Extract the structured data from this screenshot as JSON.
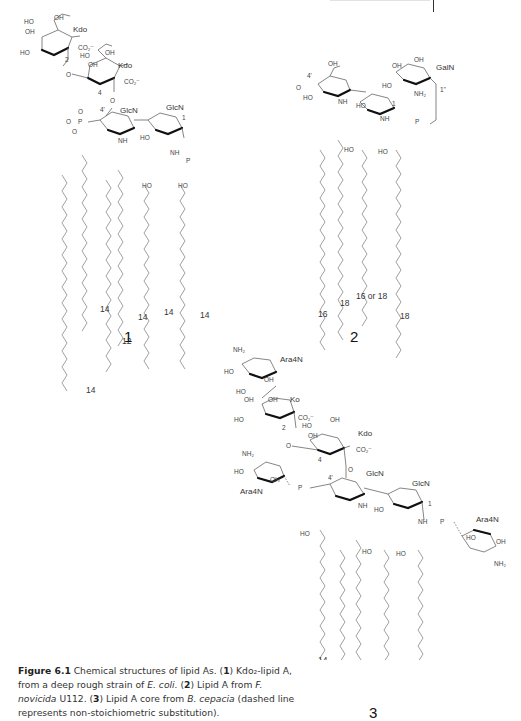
{
  "page": {
    "header_rule": true
  },
  "structures": [
    {
      "number": "1",
      "sugars": [
        "Kdo",
        "Kdo",
        "GlcN",
        "GlcN"
      ],
      "positions": [
        "2",
        "4",
        "4'",
        "1"
      ],
      "groups": [
        "OH",
        "HO",
        "CO2-",
        "NH",
        "O",
        "P"
      ],
      "chain_lengths": [
        "14",
        "12",
        "14",
        "14",
        "14",
        "14"
      ]
    },
    {
      "number": "2",
      "sugars": [
        "GalN"
      ],
      "positions": [
        "4'",
        "1",
        "1''"
      ],
      "groups": [
        "OH",
        "HO",
        "NH2",
        "NH",
        "O",
        "P"
      ],
      "chain_lengths": [
        "16",
        "18",
        "16 or 18",
        "18"
      ]
    },
    {
      "number": "3",
      "sugars": [
        "Ara4N",
        "Ko",
        "Kdo",
        "Ara4N",
        "GlcN",
        "GlcN",
        "Ara4N"
      ],
      "positions": [
        "2",
        "4",
        "4'",
        "1"
      ],
      "groups": [
        "NH2",
        "OH",
        "HO",
        "CO2-",
        "NH",
        "O",
        "P"
      ],
      "chain_lengths": [
        "14",
        "14",
        "16",
        "14",
        "16"
      ]
    }
  ],
  "labels": {
    "kdo": "Kdo",
    "ko": "Ko",
    "glcn": "GlcN",
    "galn": "GalN",
    "ara4n": "Ara4N",
    "oh": "OH",
    "ho": "HO",
    "co2": "CO₂⁻",
    "nh": "NH",
    "nh2": "NH₂",
    "o": "O",
    "p": "P",
    "pos2": "2",
    "pos4": "4",
    "pos4p": "4'",
    "pos1": "1",
    "pos1pp": "1''",
    "n12": "12",
    "n14": "14",
    "n16": "16",
    "n18": "18",
    "n16or18": "16 or 18"
  },
  "caption": {
    "figure_label": "Figure 6.1",
    "text_1": " Chemical structures of lipid As. (",
    "ref_1": "1",
    "text_2": ") Kdo₂-lipid A, from a deep rough strain of ",
    "species_1": "E. coli.",
    "text_3": " (",
    "ref_2": "2",
    "text_4": ") Lipid A from ",
    "species_2": "F. novicida",
    "text_5": " U112. (",
    "ref_3": "3",
    "text_6": ") Lipid A core from ",
    "species_3": "B. cepacia",
    "text_7": " (dashed line represents non-stoichiometric substitution)."
  }
}
